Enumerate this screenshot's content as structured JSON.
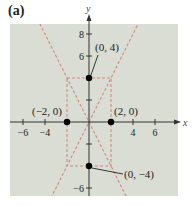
{
  "panel_label": "(a)",
  "chart_data": {
    "type": "scatter",
    "title": "",
    "xlabel": "x",
    "ylabel": "y",
    "xlim": [
      -7.2,
      8.1
    ],
    "ylim": [
      -6.7,
      8.9
    ],
    "grid": false,
    "x_ticks": [
      -6,
      -4,
      -2,
      2,
      4,
      6
    ],
    "x_tick_labels": [
      "-6",
      "-4",
      "",
      "",
      "4",
      "6"
    ],
    "y_ticks": [
      -6,
      -4,
      -2,
      2,
      4,
      6,
      8
    ],
    "y_tick_labels": [
      "-6",
      "",
      "",
      "",
      "",
      "6",
      "8"
    ],
    "points": [
      {
        "x": 0,
        "y": 4,
        "label": "(0, 4)"
      },
      {
        "x": 0,
        "y": -4,
        "label": "(0, −4)"
      },
      {
        "x": -2,
        "y": 0,
        "label": "(−2, 0)"
      },
      {
        "x": 2,
        "y": 0,
        "label": "(2, 0)"
      }
    ],
    "asymptotes": [
      {
        "equation": "y = 2x",
        "slope": 2,
        "style": "dashed"
      },
      {
        "equation": "y = -2x",
        "slope": -2,
        "style": "dashed"
      }
    ],
    "fundamental_rectangle": {
      "x": [
        -2,
        2
      ],
      "y": [
        -4,
        4
      ],
      "style": "dashed"
    },
    "colors": {
      "plot_background": "#d9ddd3",
      "dashed_lines": "#d08a86",
      "axes": "#333333",
      "points": "#000000"
    }
  }
}
